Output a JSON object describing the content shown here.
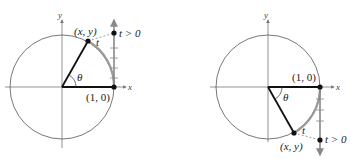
{
  "figure": {
    "panels": [
      {
        "id": "left",
        "axis_x_label": "x",
        "axis_y_label": "y",
        "point_label": "(x, y)",
        "arc_label": "t",
        "angle_label": "θ",
        "origin_point_label": "(1, 0)",
        "line_label": "t > 0"
      },
      {
        "id": "right",
        "axis_x_label": "x",
        "axis_y_label": "y",
        "point_label": "(x, y)",
        "arc_label": "t",
        "angle_label": "θ",
        "origin_point_label": "(1, 0)",
        "line_label": "t > 0"
      }
    ],
    "colors": {
      "axis": "#777777",
      "circle": "#555555",
      "radius": "#111111",
      "arc_highlight": "#9a9a9a",
      "point": "#111111"
    }
  }
}
